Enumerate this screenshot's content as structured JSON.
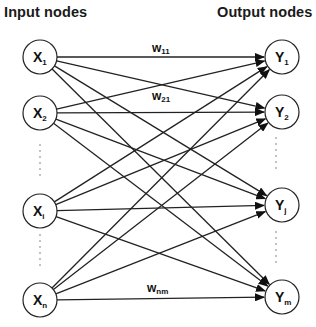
{
  "headers": {
    "input": "Input nodes",
    "output": "Output nodes"
  },
  "input_nodes": [
    {
      "id": "x1",
      "base": "X",
      "sub": "1",
      "cx": 40,
      "cy": 57
    },
    {
      "id": "x2",
      "base": "X",
      "sub": "2",
      "cx": 40,
      "cy": 113
    },
    {
      "id": "xi",
      "base": "X",
      "sub": "i",
      "cx": 40,
      "cy": 211
    },
    {
      "id": "xn",
      "base": "X",
      "sub": "n",
      "cx": 40,
      "cy": 300
    }
  ],
  "output_nodes": [
    {
      "id": "y1",
      "base": "Y",
      "sub": "1",
      "cx": 282,
      "cy": 57
    },
    {
      "id": "y2",
      "base": "Y",
      "sub": "2",
      "cx": 282,
      "cy": 112
    },
    {
      "id": "yj",
      "base": "Y",
      "sub": "j",
      "cx": 282,
      "cy": 205
    },
    {
      "id": "ym",
      "base": "Y",
      "sub": "m",
      "cx": 282,
      "cy": 297
    }
  ],
  "weight_labels": [
    {
      "base": "w",
      "sub": "11",
      "x": 152,
      "y": 52
    },
    {
      "base": "w",
      "sub": "21",
      "x": 152,
      "y": 100
    },
    {
      "base": "w",
      "sub": "nm",
      "x": 147,
      "y": 292
    }
  ],
  "ellipsis": {
    "input": [
      {
        "x": 40,
        "from": 145,
        "to": 178
      },
      {
        "x": 40,
        "from": 235,
        "to": 265
      }
    ],
    "output": [
      {
        "x": 276,
        "from": 138,
        "to": 172
      },
      {
        "x": 276,
        "from": 232,
        "to": 262
      }
    ]
  },
  "node_radius": 17,
  "connectivity": "fully-connected"
}
